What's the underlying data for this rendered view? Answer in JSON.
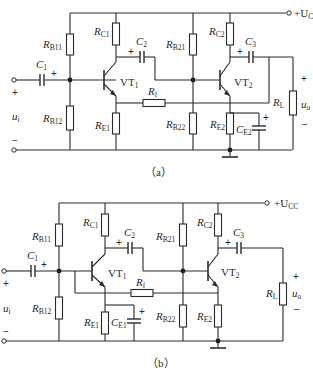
{
  "figure": {
    "subfigures": [
      {
        "id": "a",
        "caption": "（a）",
        "supply_label": "+U",
        "supply_sub": "CC",
        "components": {
          "RB11": {
            "main": "R",
            "sub": "B11"
          },
          "RB12": {
            "main": "R",
            "sub": "B12"
          },
          "RC1": {
            "main": "R",
            "sub": "C1"
          },
          "RE1": {
            "main": "R",
            "sub": "E1"
          },
          "RB21": {
            "main": "R",
            "sub": "B21"
          },
          "RB22": {
            "main": "R",
            "sub": "B22"
          },
          "RC2": {
            "main": "R",
            "sub": "C2"
          },
          "RE2": {
            "main": "R",
            "sub": "E2"
          },
          "CE2": {
            "main": "C",
            "sub": "E2"
          },
          "C1": {
            "main": "C",
            "sub": "1"
          },
          "C2": {
            "main": "C",
            "sub": "2"
          },
          "C3": {
            "main": "C",
            "sub": "3"
          },
          "Rf": {
            "main": "R",
            "sub": "f"
          },
          "RL": {
            "main": "R",
            "sub": "L"
          },
          "VT1": {
            "main": "VT",
            "sub": "1"
          },
          "VT2": {
            "main": "VT",
            "sub": "2"
          }
        },
        "input_label": {
          "main": "u",
          "sub": "i"
        },
        "output_label": {
          "main": "u",
          "sub": "o"
        },
        "plus": "+",
        "minus": "−"
      },
      {
        "id": "b",
        "caption": "（b）",
        "supply_label": "+U",
        "supply_sub": "CC",
        "components": {
          "RB11": {
            "main": "R",
            "sub": "B11"
          },
          "RB12": {
            "main": "R",
            "sub": "B12"
          },
          "RC1": {
            "main": "R",
            "sub": "C1"
          },
          "RE1": {
            "main": "R",
            "sub": "E1"
          },
          "CE1": {
            "main": "C",
            "sub": "E1"
          },
          "RB21": {
            "main": "R",
            "sub": "B21"
          },
          "RB22": {
            "main": "R",
            "sub": "B22"
          },
          "RC2": {
            "main": "R",
            "sub": "C2"
          },
          "RE2": {
            "main": "R",
            "sub": "E2"
          },
          "C1": {
            "main": "C",
            "sub": "1"
          },
          "C2": {
            "main": "C",
            "sub": "2"
          },
          "C3": {
            "main": "C",
            "sub": "3"
          },
          "Rf": {
            "main": "R",
            "sub": "f"
          },
          "RL": {
            "main": "R",
            "sub": "L"
          },
          "VT1": {
            "main": "VT",
            "sub": "1"
          },
          "VT2": {
            "main": "VT",
            "sub": "2"
          }
        },
        "input_label": {
          "main": "u",
          "sub": "i"
        },
        "output_label": {
          "main": "u",
          "sub": "o"
        },
        "plus": "+",
        "minus": "−"
      }
    ]
  }
}
